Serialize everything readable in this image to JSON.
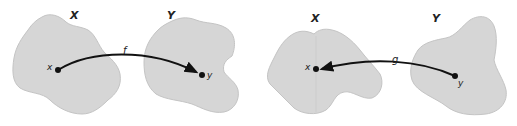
{
  "colors": {
    "blob_fill": "#d6d6d6",
    "blob_stroke": "#c4c4c4",
    "arrow": "#111111",
    "background": "#ffffff"
  },
  "diagrams": [
    {
      "name": "mapping-f",
      "domain_set": {
        "label": "X",
        "point": "x"
      },
      "codomain_set": {
        "label": "Y",
        "point": "y"
      },
      "function_label": "f",
      "direction": "X to Y"
    },
    {
      "name": "mapping-g",
      "domain_set": {
        "label": "X",
        "point": "x"
      },
      "codomain_set": {
        "label": "Y",
        "point": "y"
      },
      "function_label": "g",
      "direction": "Y to X"
    }
  ]
}
